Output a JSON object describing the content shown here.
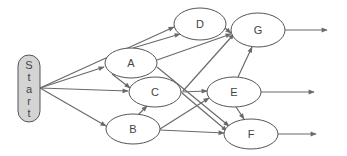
{
  "diagram": {
    "type": "directed-network",
    "colors": {
      "edge": "#6a6a6a",
      "node_stroke": "#555555",
      "start_fill": "#d4d4d4",
      "node_fill": "#ffffff",
      "text": "#444444"
    },
    "start": {
      "id": "Start",
      "label": "Start",
      "letters": [
        "S",
        "t",
        "a",
        "r",
        "t"
      ],
      "x": 18,
      "y": 55,
      "w": 22,
      "h": 67
    },
    "nodes": [
      {
        "id": "D",
        "label": "D",
        "cx": 200,
        "cy": 24,
        "rx": 26,
        "ry": 16
      },
      {
        "id": "A",
        "label": "A",
        "cx": 131,
        "cy": 63,
        "rx": 26,
        "ry": 15
      },
      {
        "id": "C",
        "label": "C",
        "cx": 155,
        "cy": 92,
        "rx": 26,
        "ry": 15
      },
      {
        "id": "B",
        "label": "B",
        "cx": 133,
        "cy": 129,
        "rx": 27,
        "ry": 15
      },
      {
        "id": "G",
        "label": "G",
        "cx": 258,
        "cy": 30,
        "rx": 27,
        "ry": 17
      },
      {
        "id": "E",
        "label": "E",
        "cx": 234,
        "cy": 92,
        "rx": 27,
        "ry": 15
      },
      {
        "id": "F",
        "label": "F",
        "cx": 251,
        "cy": 134,
        "rx": 27,
        "ry": 15
      }
    ],
    "edges": [
      {
        "from": "Start",
        "to": "D",
        "x1": 40,
        "y1": 88,
        "x2": 174,
        "y2": 27
      },
      {
        "from": "Start",
        "to": "A",
        "x1": 40,
        "y1": 88,
        "x2": 104,
        "y2": 67
      },
      {
        "from": "Start",
        "to": "C",
        "x1": 40,
        "y1": 88,
        "x2": 128,
        "y2": 91
      },
      {
        "from": "Start",
        "to": "B",
        "x1": 40,
        "y1": 88,
        "x2": 106,
        "y2": 126
      },
      {
        "from": "A",
        "to": "D",
        "x1": 133,
        "y1": 48,
        "x2": 180,
        "y2": 34
      },
      {
        "from": "A",
        "to": "G",
        "x1": 157,
        "y1": 60,
        "x2": 231,
        "y2": 34
      },
      {
        "from": "A",
        "to": "C",
        "x1": 112,
        "y1": 74,
        "x2": 130,
        "y2": 88
      },
      {
        "from": "A",
        "to": "F",
        "x1": 157,
        "y1": 67,
        "x2": 229,
        "y2": 126
      },
      {
        "from": "C",
        "to": "G",
        "x1": 183,
        "y1": 91,
        "x2": 234,
        "y2": 34
      },
      {
        "from": "C",
        "to": "E",
        "x1": 181,
        "y1": 92,
        "x2": 207,
        "y2": 91
      },
      {
        "from": "C",
        "to": "F",
        "x1": 182,
        "y1": 93,
        "x2": 227,
        "y2": 131
      },
      {
        "from": "B",
        "to": "C",
        "x1": 138,
        "y1": 115,
        "x2": 147,
        "y2": 106
      },
      {
        "from": "B",
        "to": "E",
        "x1": 160,
        "y1": 129,
        "x2": 209,
        "y2": 98
      },
      {
        "from": "B",
        "to": "F",
        "x1": 160,
        "y1": 130,
        "x2": 224,
        "y2": 133
      },
      {
        "from": "D",
        "to": "G",
        "x1": 225,
        "y1": 28,
        "x2": 231,
        "y2": 33
      },
      {
        "from": "E",
        "to": "G",
        "x1": 238,
        "y1": 77,
        "x2": 252,
        "y2": 47
      },
      {
        "from": "E",
        "to": "F",
        "x1": 236,
        "y1": 107,
        "x2": 244,
        "y2": 119
      },
      {
        "from": "G",
        "to": "out",
        "x1": 285,
        "y1": 30,
        "x2": 327,
        "y2": 30
      },
      {
        "from": "E",
        "to": "out",
        "x1": 261,
        "y1": 92,
        "x2": 314,
        "y2": 92
      },
      {
        "from": "F",
        "to": "out",
        "x1": 278,
        "y1": 134,
        "x2": 316,
        "y2": 134
      }
    ]
  }
}
